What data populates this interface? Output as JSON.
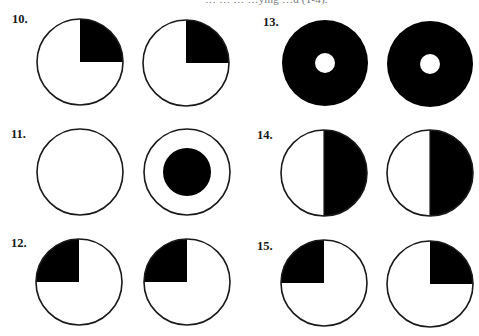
{
  "page": {
    "top_cutoff_text": "…   …         … …ying   …d (1-4)."
  },
  "colors": {
    "fill": "#000000",
    "outline": "#1a1a1a",
    "background": "#ffffff"
  },
  "items": [
    {
      "number": "10.",
      "label_pos": [
        12,
        13
      ],
      "figures": [
        {
          "cx": 80,
          "cy": 62,
          "r": 43,
          "type": "quadrant",
          "shaded_quadrant": "top-right"
        },
        {
          "cx": 186,
          "cy": 63,
          "r": 43,
          "type": "quadrant",
          "shaded_quadrant": "top-right"
        }
      ]
    },
    {
      "number": "11.",
      "label_pos": [
        11,
        128
      ],
      "figures": [
        {
          "cx": 80,
          "cy": 172,
          "r": 43,
          "type": "empty"
        },
        {
          "cx": 187,
          "cy": 172,
          "r": 43,
          "type": "center-dot",
          "inner_r": 24
        }
      ]
    },
    {
      "number": "12.",
      "label_pos": [
        11,
        237
      ],
      "figures": [
        {
          "cx": 79,
          "cy": 282,
          "r": 43,
          "type": "quadrant",
          "shaded_quadrant": "top-left"
        },
        {
          "cx": 187,
          "cy": 282,
          "r": 43,
          "type": "quadrant",
          "shaded_quadrant": "top-left"
        }
      ]
    },
    {
      "number": "13.",
      "label_pos": [
        263,
        16
      ],
      "figures": [
        {
          "cx": 325,
          "cy": 63,
          "r": 43,
          "type": "ring",
          "hole_r": 10
        },
        {
          "cx": 430,
          "cy": 64,
          "r": 43,
          "type": "ring",
          "hole_r": 10
        }
      ]
    },
    {
      "number": "14.",
      "label_pos": [
        257,
        129
      ],
      "figures": [
        {
          "cx": 324,
          "cy": 173,
          "r": 43,
          "type": "half",
          "shaded_half": "right"
        },
        {
          "cx": 430,
          "cy": 173,
          "r": 43,
          "type": "half",
          "shaded_half": "right"
        }
      ]
    },
    {
      "number": "15.",
      "label_pos": [
        257,
        240
      ],
      "figures": [
        {
          "cx": 324,
          "cy": 283,
          "r": 43,
          "type": "quadrant",
          "shaded_quadrant": "top-left"
        },
        {
          "cx": 430,
          "cy": 284,
          "r": 43,
          "type": "quadrant",
          "shaded_quadrant": "top-right"
        }
      ]
    }
  ]
}
